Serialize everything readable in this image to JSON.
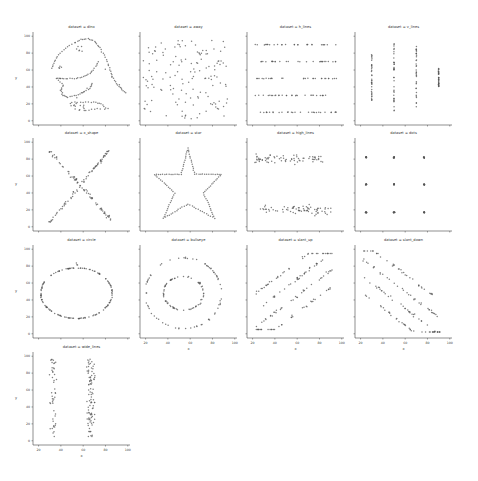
{
  "chart_data": {
    "type": "scatter",
    "layout": {
      "cols": 4,
      "rows": 4,
      "grid": false,
      "legend": "none"
    },
    "shared_axes": {
      "xlabel": "x",
      "ylabel": "y",
      "xlim": [
        15,
        102
      ],
      "ylim": [
        -5,
        105
      ],
      "xticks": [
        20,
        40,
        60,
        80,
        100
      ],
      "yticks": [
        0,
        20,
        40,
        60,
        80,
        100
      ]
    },
    "panels": [
      {
        "title": "dataset = dino",
        "shape": "dinosaur"
      },
      {
        "title": "dataset = away",
        "shape": "random"
      },
      {
        "title": "dataset = h_lines",
        "shape": "horizontal lines",
        "y_levels": [
          10,
          30,
          50,
          70,
          90
        ]
      },
      {
        "title": "dataset = v_lines",
        "shape": "vertical lines",
        "x_levels": [
          30,
          50,
          70,
          90
        ]
      },
      {
        "title": "dataset = x_shape",
        "shape": "X"
      },
      {
        "title": "dataset = star",
        "shape": "star"
      },
      {
        "title": "dataset = high_lines",
        "shape": "two horizontal bands",
        "y_levels": [
          20,
          80
        ]
      },
      {
        "title": "dataset = dots",
        "shape": "3x3 dot grid",
        "x_levels": [
          25,
          50,
          77
        ],
        "y_levels": [
          17,
          50,
          82
        ]
      },
      {
        "title": "dataset = circle",
        "shape": "circle",
        "center": [
          54,
          48
        ],
        "radius": [
          32,
          30
        ]
      },
      {
        "title": "dataset = bullseye",
        "shape": "concentric rings",
        "center": [
          54,
          48
        ]
      },
      {
        "title": "dataset = slant_up",
        "shape": "parallel upward lines"
      },
      {
        "title": "dataset = slant_down",
        "shape": "parallel downward lines"
      },
      {
        "title": "dataset = wide_lines",
        "shape": "two vertical bands",
        "x_levels": [
          35,
          65
        ]
      }
    ]
  },
  "labels": {
    "x": "x",
    "y": "y"
  }
}
